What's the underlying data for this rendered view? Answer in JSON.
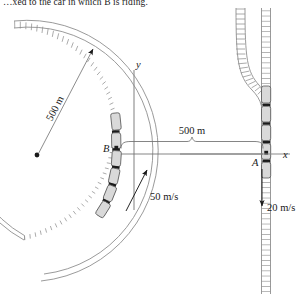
{
  "figure": {
    "caption": "…xed to the car in which B is riding.",
    "type": "mechanics-kinematics-diagram",
    "background_color": "#ffffff",
    "ink_color": "#1a1a1a",
    "rail_color": "#8c8c8c",
    "car_fill": "#d9d9d9"
  },
  "labels": {
    "radius_label": "500 m",
    "separation_label": "500 m",
    "speed_b": "50 m/s",
    "speed_a": "20 m/s",
    "point_b": "B",
    "point_a": "A",
    "axis_x": "x",
    "axis_y": "y"
  },
  "geometry": {
    "curve_center": {
      "x": 37,
      "y": 155
    },
    "curve_radius_px": 122,
    "point_b": {
      "x": 118,
      "y": 148
    },
    "point_a": {
      "x": 266,
      "y": 154
    },
    "dimension_span_label": "500 m"
  },
  "values": {
    "track_radius_m": 500,
    "separation_m": 500,
    "speed_b_ms": 50,
    "speed_a_ms": 20
  }
}
